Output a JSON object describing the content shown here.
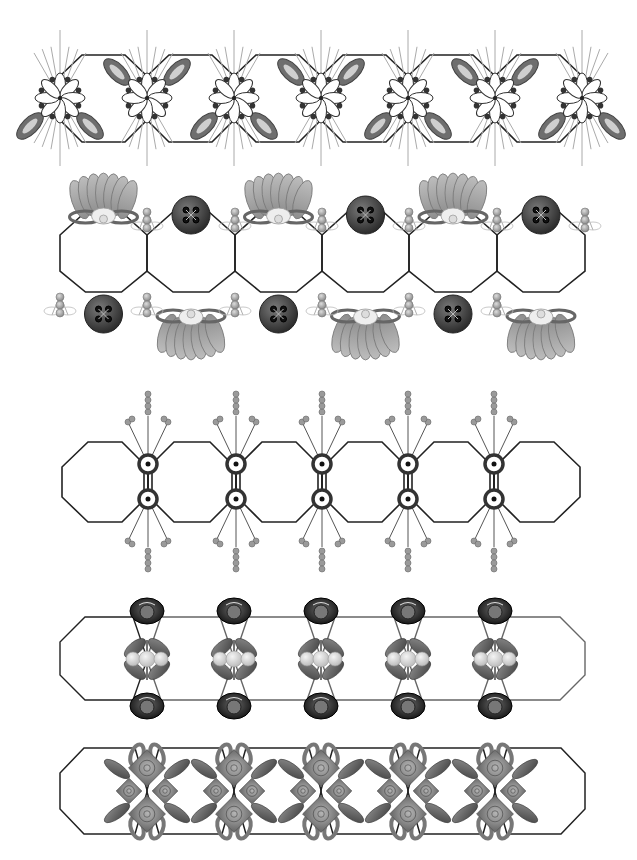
{
  "artwork": {
    "description": "Five decorative border strips made of linked octagons with ornaments at the joints",
    "background": "#ffffff",
    "line_color": "#222222",
    "rows": [
      {
        "id": "row-1",
        "motif": "line-flowers-with-teardrop-leaves",
        "octagon_count": 6,
        "ornament_count": 7,
        "ornament_x": [
          60,
          147,
          234,
          321,
          408,
          495,
          582
        ],
        "y_top": 55,
        "y_bottom": 142,
        "colors": {
          "petal": "#ffffff",
          "dot": "#333333",
          "leaf": "#6e6e6e",
          "ray": "#aaaaaa"
        }
      },
      {
        "id": "row-2",
        "motif": "buttons-bouquets-and-beads",
        "octagon_count": 6,
        "vertex_x": [
          60,
          147,
          235,
          322,
          409,
          497,
          585
        ],
        "y_top": 210,
        "y_bottom": 292,
        "colors": {
          "button": "#3c3c3c",
          "bouquet": "#a8a8a8",
          "bead": "#b5b5b5"
        }
      },
      {
        "id": "row-3",
        "motif": "bullseye-nodes-with-beaded-sprays",
        "octagon_count": 6,
        "node_x": [
          148,
          236,
          322,
          408,
          494
        ],
        "y_top": 442,
        "y_bottom": 522,
        "colors": {
          "node": "#333333",
          "bead": "#9a9a9a"
        }
      },
      {
        "id": "row-4",
        "motif": "dark-roses-with-pearl-trios",
        "octagon_count": 6,
        "joint_x": [
          147,
          234,
          321,
          408,
          495
        ],
        "y_top": 617,
        "y_bottom": 700,
        "colors": {
          "rose": "#2a2a2a",
          "leaf": "#6a6a6a",
          "pearl": "#d8d8d8"
        }
      },
      {
        "id": "row-5",
        "motif": "rose-clusters-with-bows",
        "octagon_count": 6,
        "joint_x": [
          147,
          234,
          321,
          408,
          495
        ],
        "y_top": 748,
        "y_bottom": 834,
        "colors": {
          "rose": "#8c8c8c",
          "leaf": "#6a6a6a",
          "bow": "#7d7d7d"
        }
      }
    ]
  }
}
